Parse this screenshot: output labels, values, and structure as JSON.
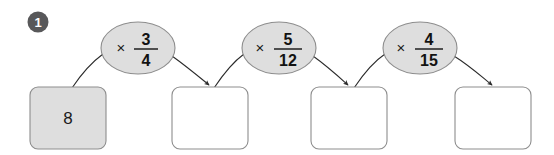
{
  "question": {
    "number": "1",
    "badge_color": "#58585a"
  },
  "colors": {
    "box_fill_filled": "#dedede",
    "box_fill_blank": "#ffffff",
    "box_stroke": "#8d8d8d",
    "ellipse_fill": "#dedede",
    "ellipse_stroke": "#8d8d8d",
    "arrow_stroke": "#2b2b2b",
    "text": "#121212",
    "background": "#ffffff"
  },
  "boxes": [
    {
      "id": "box-1",
      "value": "8",
      "state": "filled",
      "x": 30,
      "y": 87,
      "w": 76,
      "h": 62
    },
    {
      "id": "box-2",
      "value": "",
      "state": "blank",
      "x": 172,
      "y": 87,
      "w": 76,
      "h": 62
    },
    {
      "id": "box-3",
      "value": "",
      "state": "blank",
      "x": 311,
      "y": 87,
      "w": 76,
      "h": 62
    },
    {
      "id": "box-4",
      "value": "",
      "state": "blank",
      "x": 455,
      "y": 87,
      "w": 76,
      "h": 62
    }
  ],
  "operations": [
    {
      "id": "op-1",
      "operator": "×",
      "numerator": "3",
      "denominator": "4",
      "cx": 138,
      "cy": 48,
      "rx": 37,
      "ry": 26
    },
    {
      "id": "op-2",
      "operator": "×",
      "numerator": "5",
      "denominator": "12",
      "cx": 279,
      "cy": 48,
      "rx": 37,
      "ry": 26
    },
    {
      "id": "op-3",
      "operator": "×",
      "numerator": "4",
      "denominator": "15",
      "cx": 420,
      "cy": 48,
      "rx": 37,
      "ry": 26
    }
  ],
  "connectors": [
    {
      "id": "conn-in-1",
      "from": "box-1",
      "to": "op-1",
      "arrowhead": false
    },
    {
      "id": "conn-out-1",
      "from": "op-1",
      "to": "box-2",
      "arrowhead": true
    },
    {
      "id": "conn-in-2",
      "from": "box-2",
      "to": "op-2",
      "arrowhead": false
    },
    {
      "id": "conn-out-2",
      "from": "op-2",
      "to": "box-3",
      "arrowhead": true
    },
    {
      "id": "conn-in-3",
      "from": "box-3",
      "to": "op-3",
      "arrowhead": false
    },
    {
      "id": "conn-out-3",
      "from": "op-3",
      "to": "box-4",
      "arrowhead": true
    }
  ]
}
